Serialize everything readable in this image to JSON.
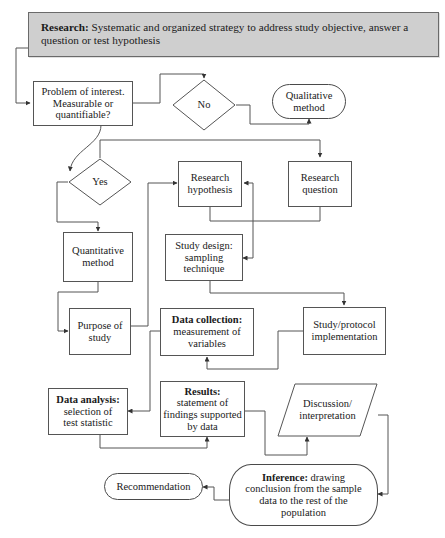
{
  "diagram": {
    "colors": {
      "banner_fill": "#cfcfcf",
      "stroke": "#555555",
      "text": "#1a1a1a",
      "background": "#ffffff"
    },
    "nodes": {
      "research": {
        "label_bold": "Research:",
        "label_rest": " Systematic and organized strategy to address study objective, answer a question or test hypothesis",
        "shape": "banner-rectangle"
      },
      "problem": {
        "label": "Problem of interest.\nMeasurable or\nquantifiable?",
        "shape": "rectangle"
      },
      "no": {
        "label": "No",
        "shape": "diamond"
      },
      "qualitative": {
        "label": "Qualitative\nmethod",
        "shape": "stadium"
      },
      "yes": {
        "label": "Yes",
        "shape": "diamond"
      },
      "quantitative": {
        "label": "Quantitative\nmethod",
        "shape": "rectangle"
      },
      "research_hypothesis": {
        "label": "Research\nhypothesis",
        "shape": "rectangle"
      },
      "research_question": {
        "label": "Research\nquestion",
        "shape": "rectangle"
      },
      "study_design": {
        "label": "Study design:\nsampling\ntechnique",
        "shape": "rectangle"
      },
      "purpose": {
        "label": "Purpose of\nstudy",
        "shape": "rectangle"
      },
      "data_collection": {
        "label_bold": "Data collection:",
        "label_rest": "measurement of\nvariables",
        "shape": "rectangle"
      },
      "study_protocol": {
        "label": "Study/protocol\nimplementation",
        "shape": "rectangle"
      },
      "data_analysis": {
        "label_bold": "Data analysis:",
        "label_rest": "selection of\ntest statistic",
        "shape": "rectangle"
      },
      "results": {
        "label_bold": "Results:",
        "label_rest": "statement of\nfindings supported\nby data",
        "shape": "rectangle"
      },
      "discussion": {
        "label": "Discussion/\ninterpretation",
        "shape": "parallelogram"
      },
      "recommendation": {
        "label": "Recommendation",
        "shape": "stadium"
      },
      "inference": {
        "label_bold": "Inference:",
        "label_rest": " drawing conclusion from the sample data to the rest of the population",
        "shape": "stadium"
      }
    },
    "edges": [
      {
        "from": "research",
        "to": "problem"
      },
      {
        "from": "problem",
        "to": "no"
      },
      {
        "from": "no",
        "to": "qualitative"
      },
      {
        "from": "problem",
        "to": "yes"
      },
      {
        "from": "yes",
        "to": "quantitative"
      },
      {
        "from": "yes",
        "to": "research_question"
      },
      {
        "from": "research_question",
        "to": "research_hypothesis"
      },
      {
        "from": "research_hypothesis",
        "to": "study_design"
      },
      {
        "from": "quantitative",
        "to": "purpose"
      },
      {
        "from": "purpose",
        "to": "research_hypothesis"
      },
      {
        "from": "study_design",
        "to": "study_protocol"
      },
      {
        "from": "study_protocol",
        "to": "data_collection"
      },
      {
        "from": "data_collection",
        "to": "data_analysis"
      },
      {
        "from": "data_analysis",
        "to": "results"
      },
      {
        "from": "results",
        "to": "discussion"
      },
      {
        "from": "discussion",
        "to": "inference"
      },
      {
        "from": "inference",
        "to": "recommendation"
      }
    ]
  }
}
